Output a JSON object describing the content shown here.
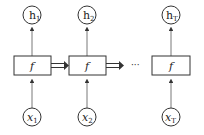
{
  "diagram": {
    "type": "unrolled-recurrent-network",
    "colors": {
      "stroke": "#333333",
      "text": "#222222",
      "background": "#ffffff"
    },
    "ellipsis": "···",
    "steps": [
      {
        "output": {
          "base": "h",
          "sub": "1"
        },
        "cell": "f",
        "input": {
          "base": "x",
          "sub": "1"
        }
      },
      {
        "output": {
          "base": "h",
          "sub": "2"
        },
        "cell": "f",
        "input": {
          "base": "x",
          "sub": "2"
        }
      },
      {
        "output": {
          "base": "h",
          "sub": "T"
        },
        "cell": "f",
        "input": {
          "base": "x",
          "sub": "T"
        }
      }
    ]
  }
}
